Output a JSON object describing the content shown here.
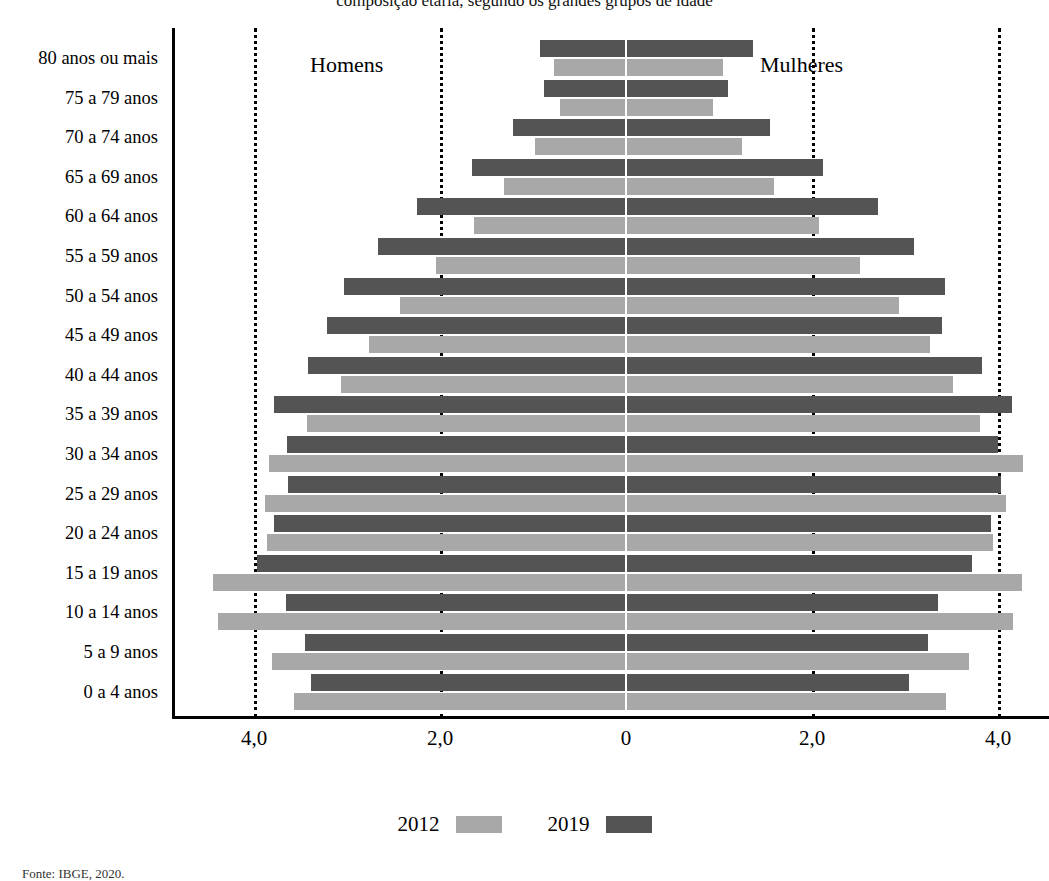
{
  "top_title_sliver": "composição etária, segundo os grandes grupos de idade",
  "regions": {
    "left_label": "Homens",
    "right_label": "Mulheres"
  },
  "legend": {
    "position": "bottom-center",
    "items": [
      {
        "label": "2012",
        "color": "#a8a8a8"
      },
      {
        "label": "2019",
        "color": "#545454"
      }
    ]
  },
  "source_note": "Fonte: IBGE, 2020.",
  "colors": {
    "series_2012": "#a8a8a8",
    "series_2019": "#545454",
    "axis": "#000000",
    "gridline": "#000000"
  },
  "axis": {
    "x_ticks": [
      "4,0",
      "2,0",
      "0",
      "2,0",
      "4,0"
    ],
    "x_tick_values": [
      -4.0,
      -2.0,
      0,
      2.0,
      4.0
    ],
    "xlim": [
      -4.8,
      4.55
    ],
    "grid": "dotted vertical at -4.0, -2.0, 2.0, 4.0"
  },
  "chart_data": {
    "type": "bar",
    "subtype": "population-pyramid",
    "title": "",
    "xlabel": "",
    "ylabel": "",
    "orientation": "horizontal",
    "grid": true,
    "legend_position": "bottom-center",
    "xlim": [
      -4.8,
      4.55
    ],
    "xticks": [
      -4.0,
      -2.0,
      0,
      2.0,
      4.0
    ],
    "xticklabels": [
      "4,0",
      "2,0",
      "0",
      "2,0",
      "4,0"
    ],
    "units": "%",
    "categories": [
      "80 anos ou mais",
      "75 a 79 anos",
      "70 a 74 anos",
      "65 a 69 anos",
      "60 a 64 anos",
      "55 a 59 anos",
      "50 a 54 anos",
      "45 a 49 anos",
      "40 a 44 anos",
      "35 a 39 anos",
      "30 a 34 anos",
      "25 a 29 anos",
      "20 a 24 anos",
      "15 a 19 anos",
      "10 a 14 anos",
      "5 a 9 anos",
      "0 a 4 anos"
    ],
    "series": [
      {
        "name": "2012",
        "side": "Homens",
        "color": "#a8a8a8",
        "values": [
          0.77,
          0.71,
          0.98,
          1.31,
          1.63,
          2.04,
          2.43,
          2.76,
          3.06,
          3.43,
          3.84,
          3.88,
          3.86,
          4.44,
          4.39,
          3.81,
          3.57
        ]
      },
      {
        "name": "2019",
        "side": "Homens",
        "color": "#545454",
        "values": [
          0.92,
          0.88,
          1.22,
          1.66,
          2.25,
          2.67,
          3.03,
          3.22,
          3.42,
          3.78,
          3.64,
          3.63,
          3.79,
          3.97,
          3.66,
          3.45,
          3.39
        ]
      },
      {
        "name": "2012",
        "side": "Mulheres",
        "color": "#a8a8a8",
        "values": [
          1.04,
          0.94,
          1.25,
          1.59,
          2.08,
          2.52,
          2.94,
          3.27,
          3.52,
          3.81,
          4.27,
          4.09,
          3.95,
          4.26,
          4.16,
          3.69,
          3.44
        ]
      },
      {
        "name": "2019",
        "side": "Mulheres",
        "color": "#545454",
        "values": [
          1.37,
          1.1,
          1.55,
          2.12,
          2.71,
          3.1,
          3.43,
          3.4,
          3.83,
          4.15,
          4.0,
          4.03,
          3.93,
          3.72,
          3.35,
          3.25,
          3.04
        ]
      }
    ]
  }
}
